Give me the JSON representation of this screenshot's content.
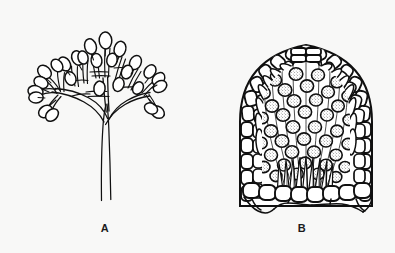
{
  "plate": {
    "kind": "scientific-line-drawing",
    "subject": "fungal reproductive structures",
    "background_color": "#f8f8f7",
    "ink_color": "#101010",
    "fill_color": "#ffffff",
    "width": 395,
    "height": 253
  },
  "figures": [
    {
      "id": "A",
      "label": "A",
      "label_x": 105,
      "label_y": 230,
      "name": "branched-conidiophore",
      "description": "Erect branched conidiophore bearing pyriform sporangia at branch tips",
      "stalk": {
        "top_y": 104,
        "bottom_y": 201,
        "left_x": 100,
        "right_x": 112,
        "tapers": true
      },
      "canopy": {
        "top_y": 16,
        "bottom_y": 110,
        "left_x": 22,
        "right_x": 162,
        "center_x": 95
      },
      "sporangia_count": 26,
      "sporangium_shape": "pyriform"
    },
    {
      "id": "B",
      "label": "B",
      "label_x": 302,
      "label_y": 230,
      "name": "perithecium-section",
      "description": "Longitudinal section of a dome-shaped perithecium showing palisade wall cells, internal stippled spores, basal paraphyses and an apical ostiole",
      "bounds": {
        "left": 240,
        "top": 42,
        "right": 373,
        "bottom": 206
      },
      "center_x": 306,
      "wall_cell_rows": 3,
      "spore_count": 44,
      "ostiole_rows": 3
    }
  ]
}
